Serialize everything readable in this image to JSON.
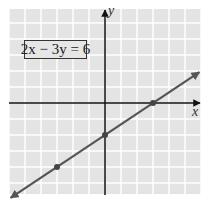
{
  "chart_data": {
    "type": "line",
    "title": "",
    "equation_label": "2x − 3y = 6",
    "xlabel": "x",
    "ylabel": "y",
    "xlim": [
      -6,
      6
    ],
    "ylim": [
      -5.7,
      6
    ],
    "grid": true,
    "tick_labels_shown": false,
    "series": [
      {
        "name": "2x - 3y = 6",
        "equation": "y = (2/3)x - 2",
        "slope": 0.6667,
        "intercept": -2,
        "x": [
          -5.9,
          5.9
        ],
        "y": [
          -5.93,
          1.93
        ],
        "marked_points": [
          {
            "x": -3,
            "y": -4
          },
          {
            "x": 0,
            "y": -2
          },
          {
            "x": 3,
            "y": 0
          }
        ],
        "color": "#555555"
      }
    ]
  },
  "style": {
    "grid_background": "#e4e4e4",
    "grid_line": "#ffffff",
    "axis_color": "#111111",
    "line_color": "#555555"
  },
  "labels": {
    "equation": "2x − 3y = 6",
    "x_axis": "x",
    "y_axis": "y"
  }
}
